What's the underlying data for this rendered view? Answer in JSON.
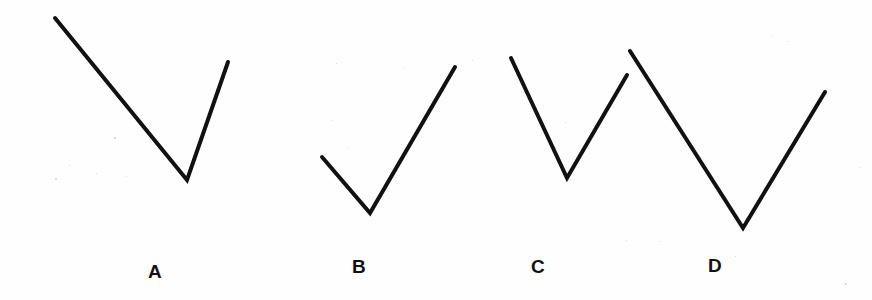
{
  "figure": {
    "background_color": "#fefefe",
    "stroke_color": "#111111",
    "stroke_width": 4,
    "width": 872,
    "height": 300
  },
  "chart_data": {
    "type": "line",
    "xlabel": "",
    "ylabel": "",
    "xlim": [
      0,
      872
    ],
    "ylim": [
      300,
      0
    ],
    "grid": false,
    "legend": "none",
    "note": "Pixel coordinates, y increases downward. Each series is a two-segment open polyline forming a V / chevron.",
    "series": [
      {
        "name": "A",
        "label": "A",
        "points": [
          [
            55,
            18
          ],
          [
            187,
            180
          ],
          [
            228,
            62
          ]
        ],
        "path": "M55,18 L187,180 L228,62"
      },
      {
        "name": "B",
        "label": "B",
        "points": [
          [
            322,
            157
          ],
          [
            370,
            213
          ],
          [
            455,
            67
          ]
        ],
        "path": "M322,157 L370,213 L455,67"
      },
      {
        "name": "C",
        "label": "C",
        "points": [
          [
            511,
            58
          ],
          [
            567,
            178
          ],
          [
            627,
            75
          ]
        ],
        "path": "M511,58 L567,178 L627,75"
      },
      {
        "name": "D",
        "label": "D",
        "points": [
          [
            630,
            51
          ],
          [
            743,
            228
          ],
          [
            825,
            92
          ]
        ],
        "path": "M630,51 L743,228 L825,92"
      }
    ]
  },
  "labels": [
    {
      "text": "A",
      "x": 148,
      "y": 262
    },
    {
      "text": "B",
      "x": 352,
      "y": 257
    },
    {
      "text": "C",
      "x": 531,
      "y": 257
    },
    {
      "text": "D",
      "x": 708,
      "y": 256
    }
  ],
  "specks": [
    {
      "x": 55,
      "y": 178,
      "size": 2
    },
    {
      "x": 69,
      "y": 165,
      "size": 1
    },
    {
      "x": 114,
      "y": 137,
      "size": 2
    },
    {
      "x": 96,
      "y": 173,
      "size": 1
    },
    {
      "x": 126,
      "y": 176,
      "size": 1
    },
    {
      "x": 336,
      "y": 63,
      "size": 1
    },
    {
      "x": 347,
      "y": 148,
      "size": 1
    },
    {
      "x": 404,
      "y": 68,
      "size": 1
    },
    {
      "x": 331,
      "y": 120,
      "size": 1
    },
    {
      "x": 472,
      "y": 60,
      "size": 1
    },
    {
      "x": 626,
      "y": 240,
      "size": 1
    },
    {
      "x": 660,
      "y": 241,
      "size": 1
    },
    {
      "x": 771,
      "y": 36,
      "size": 1
    },
    {
      "x": 787,
      "y": 41,
      "size": 1
    },
    {
      "x": 735,
      "y": 256,
      "size": 1
    },
    {
      "x": 845,
      "y": 283,
      "size": 2
    },
    {
      "x": 859,
      "y": 167,
      "size": 1
    },
    {
      "x": 565,
      "y": 122,
      "size": 1
    }
  ]
}
